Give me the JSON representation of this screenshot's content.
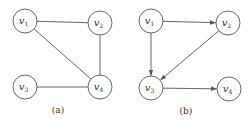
{
  "figures": [
    {
      "id": "a",
      "caption": "(a)",
      "directed": false,
      "nodes": [
        {
          "id": "v1",
          "label": "v",
          "sub": "1",
          "x": 25,
          "y": 21
        },
        {
          "id": "v2",
          "label": "v",
          "sub": "2",
          "x": 100,
          "y": 23
        },
        {
          "id": "v3",
          "label": "v",
          "sub": "3",
          "x": 25,
          "y": 87
        },
        {
          "id": "v4",
          "label": "v",
          "sub": "4",
          "x": 100,
          "y": 87
        }
      ],
      "edges": [
        {
          "from": "v1",
          "to": "v2"
        },
        {
          "from": "v1",
          "to": "v4"
        },
        {
          "from": "v2",
          "to": "v4"
        },
        {
          "from": "v3",
          "to": "v4"
        }
      ]
    },
    {
      "id": "b",
      "caption": "(b)",
      "directed": true,
      "nodes": [
        {
          "id": "v1",
          "label": "v",
          "sub": "1",
          "x": 151,
          "y": 21
        },
        {
          "id": "v2",
          "label": "v",
          "sub": "2",
          "x": 228,
          "y": 23
        },
        {
          "id": "v3",
          "label": "v",
          "sub": "3",
          "x": 151,
          "y": 88
        },
        {
          "id": "v4",
          "label": "v",
          "sub": "4",
          "x": 229,
          "y": 89
        }
      ],
      "edges": [
        {
          "from": "v1",
          "to": "v2"
        },
        {
          "from": "v1",
          "to": "v3"
        },
        {
          "from": "v2",
          "to": "v3"
        },
        {
          "from": "v3",
          "to": "v4"
        }
      ]
    }
  ],
  "style": {
    "stroke": "#555555",
    "text": "#333333",
    "background": "#ffffff",
    "node_radius": 12
  }
}
